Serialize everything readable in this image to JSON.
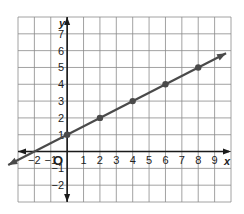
{
  "chart_data": {
    "type": "line",
    "title": "",
    "xlabel": "x",
    "ylabel": "y",
    "xlim": [
      -3,
      10
    ],
    "ylim": [
      -3,
      8
    ],
    "grid": true,
    "x_ticks": [
      "-2",
      "-1",
      "1",
      "2",
      "3",
      "4",
      "5",
      "6",
      "7",
      "8",
      "9"
    ],
    "y_ticks": [
      "-2",
      "-1",
      "1",
      "2",
      "3",
      "4",
      "5",
      "6",
      "7"
    ],
    "origin_label": "O",
    "series": [
      {
        "name": "line",
        "equation": "y = 0.5x + 1",
        "points": [
          [
            0,
            1
          ],
          [
            2,
            2
          ],
          [
            4,
            3
          ],
          [
            6,
            4
          ],
          [
            8,
            5
          ]
        ],
        "arrows": "both",
        "extent": [
          -3.6,
          9.7
        ]
      }
    ],
    "colors": {
      "line": "#4a4a4a",
      "grid": "#8a8a8a",
      "axis": "#1a1a1a",
      "text": "#222222"
    }
  }
}
